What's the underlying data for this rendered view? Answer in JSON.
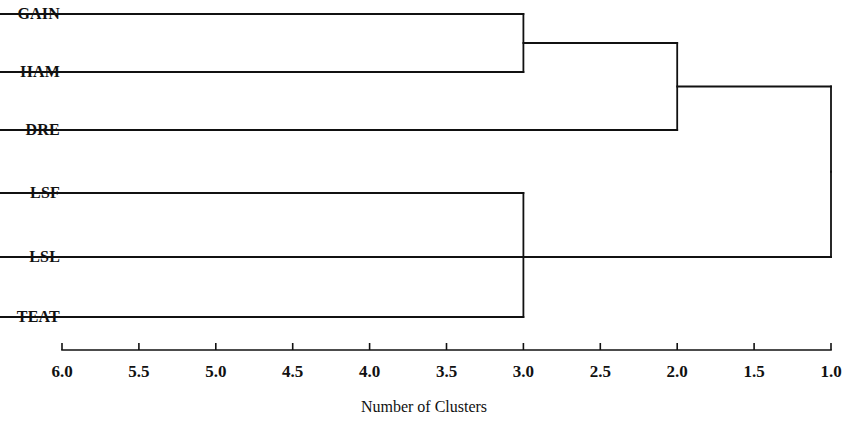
{
  "chart_data": {
    "type": "tree",
    "title": "",
    "xlabel": "Number of Clusters",
    "ylabel": "",
    "xlim": [
      6.0,
      1.0
    ],
    "x_axis_reversed": true,
    "grid": false,
    "legend": "none",
    "tick_labels": [
      "6.0",
      "5.5",
      "5.0",
      "4.5",
      "4.0",
      "3.5",
      "3.0",
      "2.5",
      "2.0",
      "1.5",
      "1.0"
    ],
    "tick_values": [
      6.0,
      5.5,
      5.0,
      4.5,
      4.0,
      3.5,
      3.0,
      2.5,
      2.0,
      1.5,
      1.0
    ],
    "leaves": [
      {
        "label": "GAIN",
        "order": 0
      },
      {
        "label": "HAM",
        "order": 1
      },
      {
        "label": "DRE",
        "order": 2
      },
      {
        "label": "LSF",
        "order": 3
      },
      {
        "label": "LSL",
        "order": 4
      },
      {
        "label": "TEAT",
        "order": 5
      }
    ],
    "merges": [
      {
        "id": "m1",
        "children": [
          "GAIN",
          "HAM"
        ],
        "num_clusters": 3.0
      },
      {
        "id": "m2",
        "children": [
          "LSF",
          "TEAT"
        ],
        "num_clusters": 3.0
      },
      {
        "id": "m3",
        "children": [
          "m1",
          "DRE"
        ],
        "num_clusters": 2.0
      },
      {
        "id": "m4",
        "children": [
          "m3",
          "LSL"
        ],
        "num_clusters": 1.0
      }
    ],
    "leaf_line_start_value": 6.45,
    "colors": {
      "line": "#111111",
      "text": "#111111",
      "background": "#ffffff"
    }
  }
}
